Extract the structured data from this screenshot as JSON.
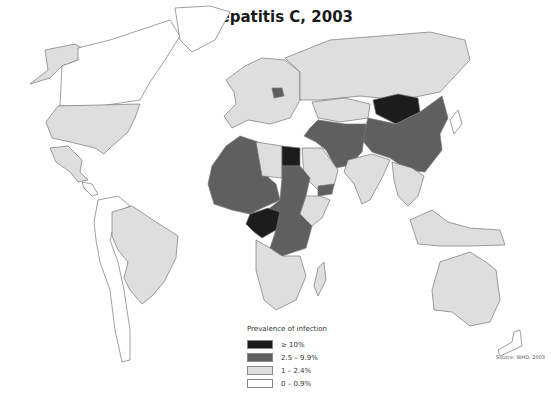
{
  "title": "Hepatitis C, 2003",
  "source": "Source: WHO, 2003",
  "colors": {
    "c1": "#1c1c1c",
    "c2": "#5f5f5f",
    "c3": "#dedede",
    "c4": "#ffffff",
    "border": "#777777"
  },
  "legend": {
    "title": "Prevalence of infection",
    "items": [
      {
        "label": "≥ 10%",
        "color": "#1c1c1c"
      },
      {
        "label": "2.5 – 9.9%",
        "color": "#5f5f5f"
      },
      {
        "label": "1 – 2.4%",
        "color": "#dedede"
      },
      {
        "label": "0 – 0.9%",
        "color": "#ffffff"
      }
    ]
  },
  "regions": [
    {
      "name": "Alaska",
      "class": "1 – 2.4%"
    },
    {
      "name": "Canada",
      "class": "0 – 0.9%"
    },
    {
      "name": "Greenland",
      "class": "0 – 0.9%"
    },
    {
      "name": "United States",
      "class": "1 – 2.4%"
    },
    {
      "name": "Mexico",
      "class": "1 – 2.4%"
    },
    {
      "name": "Central America",
      "class": "0 – 0.9%"
    },
    {
      "name": "Brazil",
      "class": "1 – 2.4%"
    },
    {
      "name": "Rest of South America",
      "class": "0 – 0.9%"
    },
    {
      "name": "Western Europe",
      "class": "1 – 2.4%"
    },
    {
      "name": "Romania",
      "class": "2.5 – 9.9%"
    },
    {
      "name": "Russia",
      "class": "1 – 2.4%"
    },
    {
      "name": "Kazakhstan",
      "class": "1 – 2.4%"
    },
    {
      "name": "Mongolia",
      "class": "≥ 10%"
    },
    {
      "name": "China",
      "class": "2.5 – 9.9%"
    },
    {
      "name": "Middle East / Central Asia",
      "class": "2.5 – 9.9%"
    },
    {
      "name": "Saudi Arabia",
      "class": "1 – 2.4%"
    },
    {
      "name": "India",
      "class": "1 – 2.4%"
    },
    {
      "name": "Southeast Asia",
      "class": "1 – 2.4%"
    },
    {
      "name": "Indonesia",
      "class": "1 – 2.4%"
    },
    {
      "name": "Australia",
      "class": "1 – 2.4%"
    },
    {
      "name": "West Africa",
      "class": "2.5 – 9.9%"
    },
    {
      "name": "Libya",
      "class": "1 – 2.4%"
    },
    {
      "name": "Egypt",
      "class": "≥ 10%"
    },
    {
      "name": "Central Africa (Cameroon, Gabon, Congo)",
      "class": "≥ 10%"
    },
    {
      "name": "Sudan / East-Central Africa",
      "class": "2.5 – 9.9%"
    },
    {
      "name": "Southern Africa",
      "class": "1 – 2.4%"
    },
    {
      "name": "Madagascar",
      "class": "1 – 2.4%"
    }
  ]
}
